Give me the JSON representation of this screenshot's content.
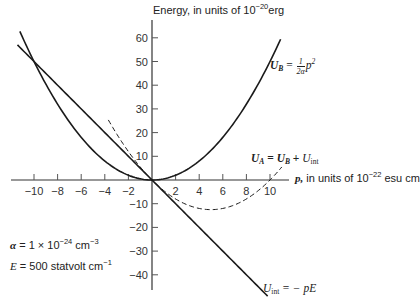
{
  "chart_data": {
    "type": "line",
    "title": "",
    "ylabel": "Energy, in units of 10^-20 erg",
    "xlabel": "p, in units of 10^-22 esu cm",
    "xlim": [
      -11.5,
      11.5
    ],
    "ylim": [
      -45,
      65
    ],
    "x_ticks": [
      -10,
      -8,
      -6,
      -4,
      -2,
      2,
      4,
      6,
      8,
      10
    ],
    "y_ticks": [
      60,
      50,
      40,
      30,
      20,
      10,
      -10,
      -20,
      -30,
      -40
    ],
    "grid": false,
    "parameters": {
      "alpha": "1 × 10^-24 cm^-3",
      "E": "500 statvolt cm^-1"
    },
    "series": [
      {
        "name": "U_B = (1/2α) p²",
        "style": "solid",
        "formula": "p^2/2",
        "x": [
          -11.2,
          -10,
          -8,
          -6,
          -4,
          -2,
          0,
          2,
          4,
          6,
          8,
          10,
          10.9
        ],
        "y": [
          62.7,
          50,
          32,
          18,
          8,
          2,
          0,
          2,
          8,
          18,
          32,
          50,
          59.4
        ]
      },
      {
        "name": "U_int = − pE",
        "style": "solid",
        "formula": "-5p",
        "x": [
          -11.4,
          -10,
          0,
          9.8
        ],
        "y": [
          57,
          50,
          0,
          -49
        ]
      },
      {
        "name": "U_A = U_B + U_int",
        "style": "dashed",
        "formula": "p^2/2 - 5p",
        "x": [
          -3.7,
          -2,
          0,
          2,
          4,
          5,
          6,
          8,
          10,
          11
        ],
        "y": [
          25.3,
          12,
          0,
          -8,
          -12,
          -12.5,
          -12,
          -8,
          0,
          5.5
        ]
      }
    ]
  },
  "labels": {
    "y_axis_prefix": "Energy, in units of 10",
    "y_axis_exp": "−20",
    "y_axis_suffix": "erg",
    "x_axis_var": "p,",
    "x_axis_prefix": " in units of 10",
    "x_axis_exp": "−22",
    "x_axis_suffix": " esu cm",
    "ub_lhs": "U",
    "ub_sub": "B",
    "ub_eq": " = ",
    "ub_num": "1",
    "ub_den": "2α",
    "ub_var": "p",
    "ub_exp": "2",
    "ua_lhs": "U",
    "ua_sub": "A",
    "ua_eq": " = ",
    "ua_t1": "U",
    "ua_t1_sub": "B",
    "ua_plus": " + ",
    "ua_t2": "U",
    "ua_t2_sub": "int",
    "uint_lhs": "U",
    "uint_sub": "int",
    "uint_rhs": " = − pE",
    "alpha_sym": "α",
    "alpha_val": " = 1 × 10",
    "alpha_exp": "−24",
    "alpha_unit": " cm",
    "alpha_unit_exp": "−3",
    "e_sym": "E",
    "e_val": " = 500 statvolt cm",
    "e_exp": "−1"
  }
}
